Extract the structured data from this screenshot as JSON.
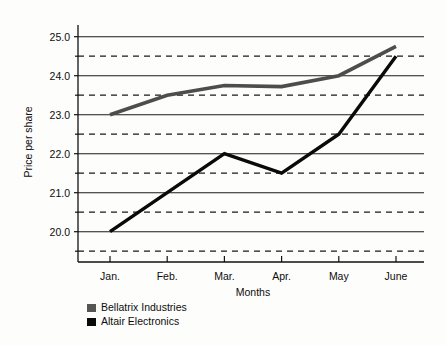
{
  "chart_data": {
    "type": "line",
    "title": "",
    "xlabel": "Months",
    "ylabel": "Price per share",
    "categories": [
      "Jan.",
      "Feb.",
      "Mar.",
      "Apr.",
      "May",
      "June"
    ],
    "ylim": [
      19.3,
      25.3
    ],
    "ytick_labels": [
      "20.0",
      "21.0",
      "22.0",
      "23.0",
      "24.0",
      "25.0"
    ],
    "ytick_values": [
      20.0,
      21.0,
      22.0,
      23.0,
      24.0,
      25.0
    ],
    "minor_gridlines": [
      19.5,
      20.5,
      21.5,
      22.5,
      23.5,
      24.5
    ],
    "grid": "major solid, minor dashed",
    "legend_position": "below-left",
    "series": [
      {
        "name": "Bellatrix Industries",
        "color": "#4d4d4d",
        "values": [
          23.0,
          23.5,
          23.75,
          23.72,
          24.0,
          24.75
        ]
      },
      {
        "name": "Altair Electronics",
        "color": "#0a0a0a",
        "values": [
          20.0,
          21.0,
          22.0,
          21.5,
          22.5,
          24.5
        ]
      }
    ]
  },
  "legend": {
    "items": [
      {
        "label": "Bellatrix Industries",
        "swatch": "#555555"
      },
      {
        "label": "Altair Electronics",
        "swatch": "#0a0a0a"
      }
    ]
  },
  "axes": {
    "y_title": "Price per share",
    "x_title": "Months"
  }
}
